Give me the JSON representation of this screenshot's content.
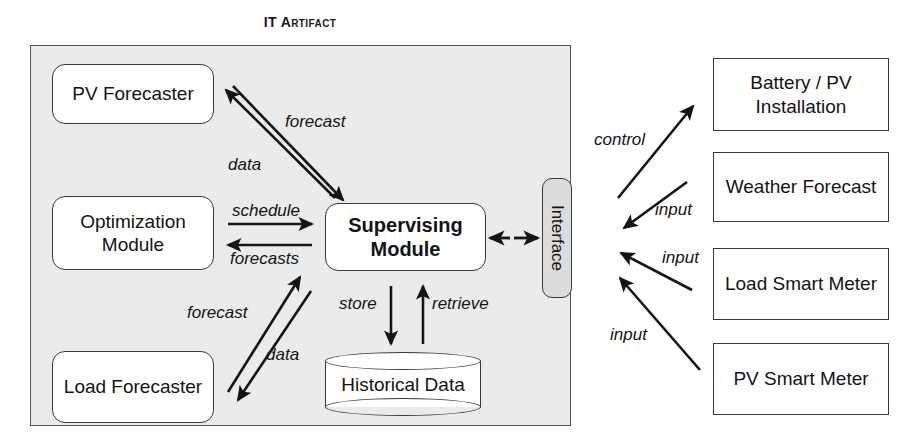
{
  "diagram": {
    "title": "IT Artifact",
    "internal_modules": [
      {
        "id": "pv-forecaster",
        "label": "PV Forecaster"
      },
      {
        "id": "optimization",
        "label": "Optimization Module"
      },
      {
        "id": "load-forecaster",
        "label": "Load Forecaster"
      },
      {
        "id": "supervising",
        "label": "Supervising Module"
      }
    ],
    "interface": {
      "label": "Interface"
    },
    "datastore": {
      "label": "Historical Data"
    },
    "external_boxes": [
      {
        "id": "ext-battery",
        "label": "Battery / PV Installation"
      },
      {
        "id": "ext-weather",
        "label": "Weather Forecast"
      },
      {
        "id": "ext-loadsm",
        "label": "Load Smart Meter"
      },
      {
        "id": "ext-pvsm",
        "label": "PV Smart Meter"
      }
    ],
    "edge_labels": {
      "forecast_pv": "forecast",
      "data_pv": "data",
      "schedule": "schedule",
      "forecasts": "forecasts",
      "forecast_load": "forecast",
      "data_load": "data",
      "store": "store",
      "retrieve": "retrieve",
      "control": "control",
      "input_weather": "input",
      "input_load_meter": "input",
      "input_pv_meter": "input"
    },
    "colors": {
      "artifact_fill": "#ebebeb",
      "interface_fill": "#dcdcdc",
      "stroke": "#3a3a3a",
      "box_fill": "#ffffff",
      "background": "#ffffff"
    }
  }
}
